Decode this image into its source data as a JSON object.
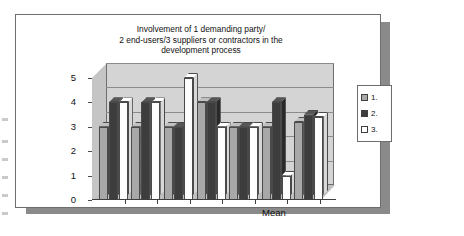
{
  "chart_data": {
    "type": "bar",
    "title": "Involvement of 1 demanding party/ 2 end-users/3 suppliers or contractors in the development process",
    "title_lines": [
      "Involvement of 1 demanding party/",
      "2 end-users/3 suppliers or contractors in the",
      "development process"
    ],
    "xlabel": "",
    "ylabel": "",
    "ylim": [
      0,
      5
    ],
    "yticks": [
      0,
      1,
      2,
      3,
      4,
      5
    ],
    "ytick_labels": [
      "0",
      "1",
      "2",
      "3",
      "4",
      "5"
    ],
    "grid": true,
    "legend_position": "right",
    "categories": [
      "",
      "",
      "",
      "",
      "",
      "",
      "Mean"
    ],
    "category_labels": [
      "",
      "",
      "",
      "",
      "",
      "",
      "Mean"
    ],
    "series": [
      {
        "name": "1.",
        "color": "#a8a8a8",
        "values": [
          3,
          3,
          3,
          4,
          3,
          3,
          3.2
        ]
      },
      {
        "name": "2.",
        "color": "#3d3d3d",
        "values": [
          4,
          4,
          3,
          4,
          3,
          4,
          3.5
        ]
      },
      {
        "name": "3.",
        "color": "#ffffff",
        "values": [
          4,
          4,
          5,
          3,
          3,
          1,
          3.4
        ]
      }
    ],
    "mean_axis_label": "Mean"
  },
  "legend": {
    "items": [
      {
        "label": "1.",
        "swatch": "legend-swatch-series-1"
      },
      {
        "label": "2.",
        "swatch": "legend-swatch-series-2"
      },
      {
        "label": "3.",
        "swatch": "legend-swatch-series-3"
      }
    ]
  },
  "colors": {
    "series_1": "#a8a8a8",
    "series_2": "#3d3d3d",
    "series_3": "#ffffff",
    "plot_background": "#d4d4d4",
    "card_background": "#ffffff",
    "card_border": "#6e6e6e",
    "shadow": "#8a8a8a",
    "axis": "#3f3f3f",
    "gridline": "#8b8b8b",
    "text": "#111111"
  }
}
